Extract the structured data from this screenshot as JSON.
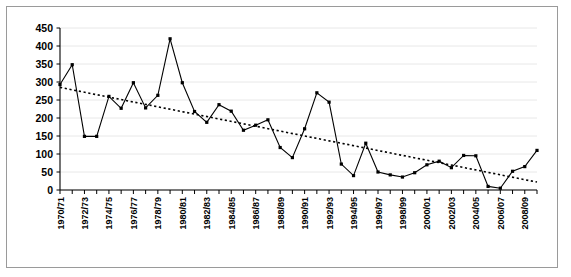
{
  "figure": {
    "border_color": "#9a9a9a",
    "background": "#ffffff"
  },
  "chart_data": {
    "type": "line",
    "title": "",
    "subtitle": "",
    "xlabel": "",
    "ylabel": "",
    "ylim": [
      0,
      450
    ],
    "yticks": [
      0,
      50,
      100,
      150,
      200,
      250,
      300,
      350,
      400,
      450
    ],
    "ytick_labels": [
      "0",
      "50",
      "100",
      "150",
      "200",
      "250",
      "300",
      "350",
      "400",
      "450"
    ],
    "grid": "horizontal",
    "grid_color": "#e8e8e8",
    "legend": "none",
    "legend_position": "none",
    "marker": "square",
    "marker_color": "#000000",
    "line_color": "#000000",
    "categories": [
      "1970/71",
      "1971/72",
      "1972/73",
      "1973/74",
      "1974/75",
      "1975/76",
      "1976/77",
      "1977/78",
      "1978/79",
      "1979/80",
      "1980/81",
      "1981/82",
      "1982/83",
      "1983/84",
      "1984/85",
      "1985/86",
      "1986/87",
      "1987/88",
      "1988/89",
      "1989/90",
      "1990/91",
      "1991/92",
      "1992/93",
      "1993/94",
      "1994/95",
      "1995/96",
      "1996/97",
      "1997/98",
      "1998/99",
      "1999/00",
      "2000/01",
      "2001/02",
      "2002/03",
      "2003/04",
      "2004/05",
      "2005/06",
      "2006/07",
      "2007/08",
      "2008/09",
      "2009/10"
    ],
    "xtick_labels": [
      "1970/71",
      "1972/73",
      "1974/75",
      "1976/77",
      "1978/79",
      "1980/81",
      "1982/83",
      "1984/85",
      "1986/87",
      "1988/89",
      "1990/91",
      "1992/93",
      "1994/95",
      "1996/97",
      "1998/99",
      "2000/01",
      "2002/03",
      "2004/05",
      "2006/07",
      "2008/09"
    ],
    "xtick_label_every": 2,
    "values": [
      293,
      348,
      149,
      149,
      260,
      227,
      298,
      228,
      263,
      420,
      298,
      218,
      188,
      237,
      219,
      166,
      180,
      195,
      118,
      90,
      170,
      270,
      244,
      72,
      40,
      130,
      50,
      42,
      36,
      48,
      70,
      80,
      62,
      96,
      95,
      10,
      5,
      52,
      65,
      110
    ],
    "trendline": {
      "type": "linear",
      "style": "dotted",
      "color": "#000000",
      "start_value": 285,
      "end_value": 22
    }
  }
}
